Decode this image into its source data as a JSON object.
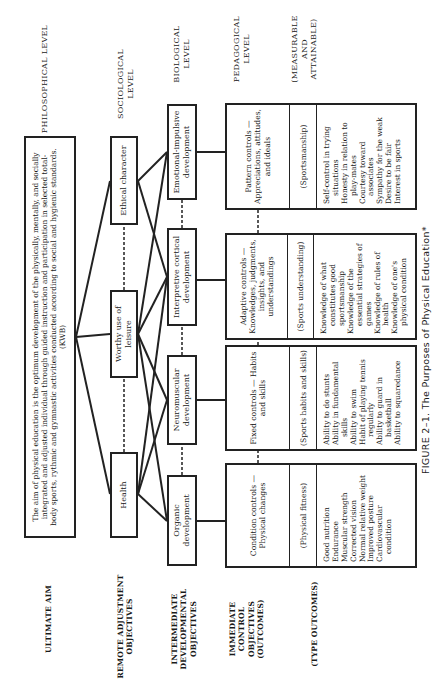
{
  "row_labels": {
    "ultimate_aim": "ULTIMATE AIM",
    "remote": "REMOTE ADJUSTMENT OBJECTIVES",
    "intermediate": "INTERMEDIATE DEVELOPMENTAL OBJECTIVES",
    "immediate": "IMMEDIATE CONTROL OBJECTIVES (OUTCOMES)",
    "type_outcomes": "(TYPE OUTCOMES)"
  },
  "level_labels": {
    "philosophical": "PHILOSOPHICAL LEVEL",
    "sociological": "SOCIOLOGICAL LEVEL",
    "biological": "BIOLOGICAL LEVEL",
    "pedagogical": "PEDAGOGICAL LEVEL",
    "measurable": "(MEASURABLE AND ATTAINABLE)"
  },
  "aim": {
    "text": "The aim of physical education is the optimum development of the physically, mentally, and socially integrated and adjusted individual through guided instruction and participation in selected total-body sports, rythmic and gymnastic activities conducted according to social and hygienic standards. (KWB)"
  },
  "remote_objectives": [
    "Health",
    "Worthy use of leisure",
    "Ethical character"
  ],
  "developmental_objectives": [
    "Organic development",
    "Neuromuscular development",
    "Interpretive cortical development",
    "Emotional-impulsive development"
  ],
  "controls": [
    {
      "control": "Condition controls — Physical changes",
      "category": "(Physical fitness)",
      "outcomes": [
        "Good nutrition",
        "Endurance",
        "Muscular strength",
        "Corrected vision",
        "Normal relative weight",
        "Improved posture",
        "Cardiovascular condition"
      ]
    },
    {
      "control": "Fixed controls — Habits and skills",
      "category": "(Sports habits and skills)",
      "outcomes": [
        "Ability to do stunts",
        "Ability in fundamental skills",
        "Ability to swim",
        "Habit of playing tennis regularly",
        "Ability to guard in basketball",
        "Ability to squaredance"
      ]
    },
    {
      "control": "Adaptive controls — Knowledges, judgments, insights, and understandings",
      "category": "(Sports understanding)",
      "outcomes": [
        "Knowledge of what constitutes good sportsmanship",
        "Knowledge of the essential strategies of games",
        "Knowledge of rules of health",
        "Knowledge of one's physical condition"
      ]
    },
    {
      "control": "Pattern controls — Appreciations, attitudes, and ideals",
      "category": "(Sportsmanship)",
      "outcomes": [
        "Self-control in trying situations",
        "Honesty in relation to play-mates",
        "Courtesy toward associates",
        "Sympathy for the weak",
        "Desire to be fair",
        "Interest in sports"
      ]
    }
  ],
  "caption": "FIGURE 2–1.   The Purposes of Physical Education*"
}
